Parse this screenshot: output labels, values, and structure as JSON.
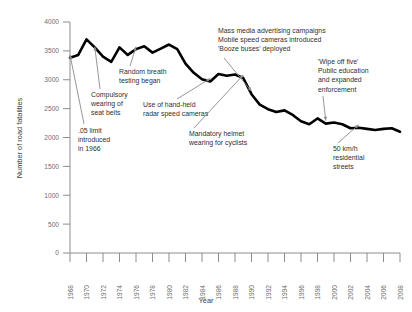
{
  "chart_data": {
    "type": "line",
    "title": "",
    "xlabel": "Year",
    "ylabel": "Number of road fatalities",
    "xlim": [
      1968,
      2008
    ],
    "ylim": [
      0,
      4000
    ],
    "grid": false,
    "legend": "none",
    "xticks": [
      "1968",
      "1970",
      "1972",
      "1974",
      "1976",
      "1978",
      "1980",
      "1982",
      "1984",
      "1986",
      "1988",
      "1990",
      "1992",
      "1994",
      "1996",
      "1998",
      "2000",
      "2002",
      "2004",
      "2006",
      "2008"
    ],
    "yticks": [
      "0",
      "500",
      "1000",
      "1500",
      "2000",
      "2500",
      "3000",
      "3500",
      "4000"
    ],
    "x": [
      1968,
      1969,
      1970,
      1971,
      1972,
      1973,
      1974,
      1975,
      1976,
      1977,
      1978,
      1979,
      1980,
      1981,
      1982,
      1983,
      1984,
      1985,
      1986,
      1987,
      1988,
      1989,
      1990,
      1991,
      1992,
      1993,
      1994,
      1995,
      1996,
      1997,
      1998,
      1999,
      2000,
      2001,
      2002,
      2003,
      2004,
      2005,
      2006,
      2007,
      2008
    ],
    "values": [
      3380,
      3430,
      3700,
      3560,
      3400,
      3310,
      3560,
      3430,
      3530,
      3580,
      3470,
      3540,
      3610,
      3530,
      3280,
      3120,
      3010,
      2970,
      3100,
      3070,
      3090,
      3030,
      2750,
      2570,
      2490,
      2440,
      2470,
      2390,
      2280,
      2230,
      2330,
      2240,
      2260,
      2230,
      2160,
      2170,
      2150,
      2130,
      2150,
      2160,
      2100
    ],
    "annotations": [
      {
        "id": "blood-alcohol-limit",
        "lines": [
          ".05 limit",
          "introduced",
          "in 1966"
        ],
        "target_year": 1968,
        "target_value": 3380
      },
      {
        "id": "seat-belts",
        "lines": [
          "Compulsory",
          "wearing of",
          "seat belts"
        ],
        "target_year": 1971,
        "target_value": 3520
      },
      {
        "id": "random-breath-testing",
        "lines": [
          "Random breath",
          "testing began"
        ],
        "target_year": 1976,
        "target_value": 3520
      },
      {
        "id": "radar-speed-cameras",
        "lines": [
          "Use of hand-held",
          "radar speed cameras"
        ],
        "target_year": 1985,
        "target_value": 2970
      },
      {
        "id": "mass-media-campaigns",
        "lines": [
          "Mass media advertising campaigns",
          "Mobile speed cameras introduced",
          "'Booze buses' deployed"
        ],
        "target_year": 1990,
        "target_value": 2750
      },
      {
        "id": "mandatory-helmets",
        "lines": [
          "Mandatory helmet",
          "wearing for cyclists"
        ],
        "target_year": 1989,
        "target_value": 3030
      },
      {
        "id": "wipe-off-five",
        "lines": [
          "'Wipe off five'",
          "Public education",
          "and expanded",
          "enforcement"
        ],
        "target_year": 1999,
        "target_value": 2240
      },
      {
        "id": "residential-speed-limit",
        "lines": [
          "50 km/h",
          "residential",
          "streets"
        ],
        "target_year": 2003,
        "target_value": 2170
      }
    ]
  },
  "colors": {
    "line": "#000000",
    "axis": "#8d8d8d",
    "tick_text": "#6d6d6d",
    "annotation_text": "#2f2f2f",
    "background": "#ffffff"
  }
}
